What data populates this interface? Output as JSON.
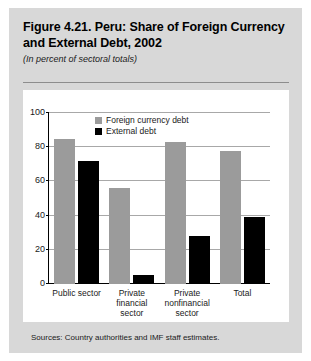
{
  "figure": {
    "title": "Figure 4.21. Peru: Share of Foreign Currency and External Debt, 2002",
    "subtitle": "(In percent of sectoral totals)",
    "source_note": "Sources: Country authorities and IMF staff estimates."
  },
  "colors": {
    "panel_background": "#d8d8d8",
    "card_background": "#ffffff",
    "foreign_currency_debt": "#9b9b9b",
    "external_debt": "#000000",
    "gridline": "#a8a8a8",
    "axis": "#000000"
  },
  "chart_data": {
    "type": "bar",
    "title": "Figure 4.21. Peru: Share of Foreign Currency and External Debt, 2002",
    "subtitle": "(In percent of sectoral totals)",
    "xlabel": "",
    "ylabel": "",
    "ylim": [
      0,
      100
    ],
    "yticks": [
      0,
      20,
      40,
      60,
      80,
      100
    ],
    "ytick_labels": [
      "0",
      "20",
      "40",
      "60",
      "80",
      "100"
    ],
    "grid": true,
    "legend_position": "top-center-inside",
    "categories": [
      "Public sector",
      "Private financial sector",
      "Private nonfinancial sector",
      "Total"
    ],
    "category_lines": [
      [
        "Public sector"
      ],
      [
        "Private",
        "financial",
        "sector"
      ],
      [
        "Private",
        "nonfinancial",
        "sector"
      ],
      [
        "Total"
      ]
    ],
    "series": [
      {
        "name": "Foreign currency debt",
        "color": "#9b9b9b",
        "values": [
          85,
          56,
          83,
          78
        ]
      },
      {
        "name": "External debt",
        "color": "#000000",
        "values": [
          72,
          5,
          28,
          39
        ]
      }
    ]
  }
}
